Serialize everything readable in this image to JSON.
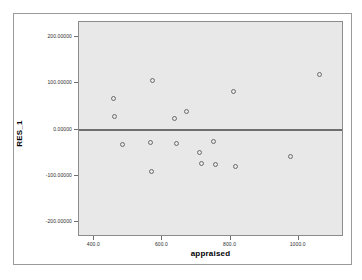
{
  "chart_data": {
    "type": "scatter",
    "title": "",
    "xlabel": "appraised",
    "ylabel": "RES_1",
    "xlim": [
      355,
      1133
    ],
    "ylim": [
      -232,
      232
    ],
    "xticks": [
      "400.0",
      "600.0",
      "800.0",
      "1000.0"
    ],
    "xtick_values": [
      400,
      600,
      800,
      1000
    ],
    "yticks": [
      "200.00000",
      "100.00000",
      "0.00000",
      "-100.00000",
      "-200.00000"
    ],
    "ytick_values": [
      200,
      100,
      0,
      -100,
      -200
    ],
    "grid": false,
    "legend": null,
    "reference_line": {
      "axis": "y",
      "value": 0,
      "color": "#6e6e6e"
    },
    "marker": {
      "shape": "open-circle",
      "color": "#6b6b6b",
      "size": 5
    },
    "plot_background": "#e8e8e8",
    "series": [
      {
        "name": "RES_1 vs appraised",
        "points": [
          {
            "x": 455,
            "y": 67
          },
          {
            "x": 460,
            "y": 28
          },
          {
            "x": 483,
            "y": -32
          },
          {
            "x": 565,
            "y": -28
          },
          {
            "x": 568,
            "y": -90
          },
          {
            "x": 572,
            "y": 105
          },
          {
            "x": 635,
            "y": 24
          },
          {
            "x": 642,
            "y": -30
          },
          {
            "x": 670,
            "y": 39
          },
          {
            "x": 708,
            "y": -49
          },
          {
            "x": 716,
            "y": -73
          },
          {
            "x": 749,
            "y": -25
          },
          {
            "x": 757,
            "y": -75
          },
          {
            "x": 810,
            "y": 83
          },
          {
            "x": 813,
            "y": -80
          },
          {
            "x": 975,
            "y": -58
          },
          {
            "x": 1060,
            "y": 118
          }
        ]
      }
    ]
  }
}
